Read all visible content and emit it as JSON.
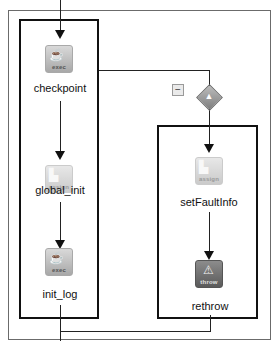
{
  "diagram": {
    "nodes": [
      {
        "id": "checkpoint",
        "label": "checkpoint",
        "type_tag": "exec",
        "icon": "coffee-cup-icon"
      },
      {
        "id": "global_init",
        "label": "global_init",
        "type_tag": "assign",
        "icon": "assign-icon"
      },
      {
        "id": "init_log",
        "label": "init_log",
        "type_tag": "exec",
        "icon": "coffee-cup-icon"
      },
      {
        "id": "setFaultInfo",
        "label": "setFaultInfo",
        "type_tag": "assign",
        "icon": "assign-icon"
      },
      {
        "id": "rethrow",
        "label": "rethrow",
        "type_tag": "throw",
        "icon": "warning-icon"
      }
    ],
    "gateway": {
      "icon": "catch-gateway-icon",
      "glyph": "▲"
    },
    "collapse_button": {
      "glyph": "−"
    },
    "glyphs": {
      "exec": "☕",
      "assign": "▙",
      "throw": "⚠"
    }
  }
}
